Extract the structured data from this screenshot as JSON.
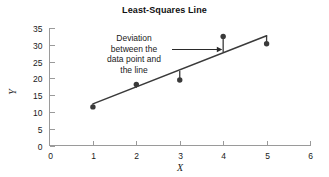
{
  "chart_data": {
    "type": "scatter",
    "title": "Least-Squares Line",
    "xlabel": "X",
    "ylabel": "Y",
    "xlim": [
      0,
      6
    ],
    "ylim": [
      0,
      35
    ],
    "grid": false,
    "legend": "none",
    "x_ticks": [
      "0",
      "1",
      "2",
      "3",
      "4",
      "5",
      "6"
    ],
    "x_tick_values": [
      0,
      1,
      2,
      3,
      4,
      5,
      6
    ],
    "y_ticks": [
      "0",
      "5",
      "10",
      "15",
      "20",
      "25",
      "30",
      "35"
    ],
    "y_tick_values": [
      0,
      5,
      10,
      15,
      20,
      25,
      30,
      35
    ],
    "x": [
      1,
      2,
      3,
      4,
      5
    ],
    "y": [
      11.5,
      18.2,
      19.5,
      32.5,
      30.3
    ],
    "points": [
      {
        "x": 1,
        "y": 11.5
      },
      {
        "x": 2,
        "y": 18.2
      },
      {
        "x": 3,
        "y": 19.5
      },
      {
        "x": 4,
        "y": 32.5
      },
      {
        "x": 5,
        "y": 30.3
      }
    ],
    "fit_line": {
      "name": "Least-squares line",
      "x_start": 1,
      "y_start": 12.4,
      "x_end": 5,
      "y_end": 32.7
    },
    "residual_highlight": {
      "x": 4,
      "y_point": 32.5,
      "y_line": 27.8
    },
    "annotation": {
      "lines": [
        "Deviation",
        "between the",
        "data point and",
        "the line"
      ],
      "arrow_from_x": 2.82,
      "arrow_to_x": 3.98,
      "arrow_y": 28.8
    },
    "colors": {
      "point": "#3a3a3a",
      "line": "#3a3a3a",
      "axis": "#9a9a9a",
      "text": "#1a1a1a",
      "background": "#ffffff"
    }
  }
}
